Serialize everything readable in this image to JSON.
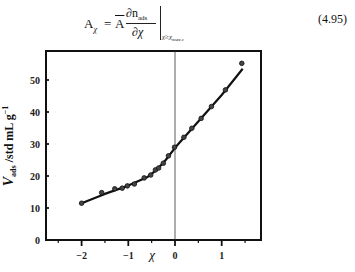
{
  "equation": {
    "lhs": "A",
    "lhs_sub": "χ",
    "equals": "=",
    "abar": "A",
    "numerator": "∂n",
    "numerator_sub": "ads",
    "denominator": "∂χ",
    "eval_sub": "χ≥χ",
    "eval_sub_sub": "max c",
    "number": "(4.95)"
  },
  "chart_data": {
    "type": "scatter",
    "title": "",
    "xlabel": "χ",
    "ylabel": "V_ads /std mL g^-1",
    "ylabel_main": "V",
    "ylabel_sub": "ads",
    "ylabel_rest": " /std mL g",
    "ylabel_sup": "−1",
    "xlim": [
      -2.6,
      1.85
    ],
    "ylim": [
      0,
      60
    ],
    "xticks": [
      -2,
      -1,
      0,
      1
    ],
    "xtick_labels": [
      "−2",
      "−1",
      "0",
      "1"
    ],
    "yticks": [
      0,
      10,
      20,
      30,
      40,
      50
    ],
    "ytick_labels": [
      "0",
      "10",
      "20",
      "30",
      "40",
      "50"
    ],
    "grid": false,
    "legend": null,
    "vertical_reference_line_x": 0,
    "series": [
      {
        "name": "measured",
        "style": "markers",
        "x": [
          -2.0,
          -1.57,
          -1.29,
          -1.13,
          -1.02,
          -0.87,
          -0.66,
          -0.52,
          -0.42,
          -0.35,
          -0.25,
          -0.14,
          -0.01,
          0.19,
          0.36,
          0.56,
          0.78,
          1.08,
          1.43
        ],
        "y": [
          11.5,
          14.8,
          16.0,
          16.2,
          16.9,
          17.5,
          19.4,
          20.3,
          21.9,
          22.5,
          24.0,
          26.3,
          29.0,
          32.1,
          34.9,
          38.0,
          41.7,
          46.9,
          55.2
        ]
      },
      {
        "name": "fit",
        "style": "line",
        "x": [
          -2.0,
          -1.5,
          -1.0,
          -0.6,
          -0.4,
          -0.2,
          0.0,
          0.5,
          1.0,
          1.45
        ],
        "y": [
          11.5,
          14.4,
          17.0,
          19.6,
          21.8,
          25.0,
          28.8,
          37.0,
          45.3,
          53.5
        ]
      }
    ]
  }
}
